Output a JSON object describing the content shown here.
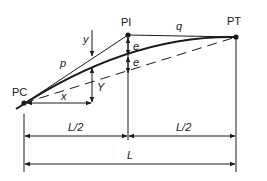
{
  "diagram": {
    "points": {
      "pc": {
        "label": "PC",
        "x": 24,
        "y": 103
      },
      "pi": {
        "label": "PI",
        "x": 128,
        "y": 35
      },
      "pt": {
        "label": "PT",
        "x": 236,
        "y": 37
      }
    },
    "labels": {
      "p": "p",
      "q": "q",
      "e_upper": "e",
      "e_lower": "e",
      "y": "y",
      "Y": "Y",
      "x": "x",
      "half_left": "L/2",
      "half_right": "L/2",
      "total": "L"
    },
    "colors": {
      "line": "#1a1a1a",
      "background": "#ffffff"
    }
  }
}
